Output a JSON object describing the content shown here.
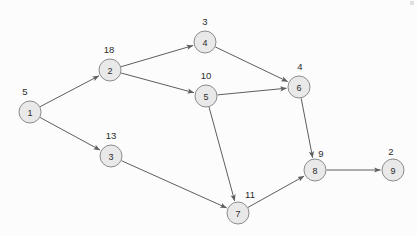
{
  "diagram": {
    "background_color": "#fcfcfc",
    "node_fill_color": "#e9e9e9",
    "node_stroke_color": "#8c8c8c",
    "edge_color": "#5e5e5e",
    "text_color": "#2b2b2b",
    "node_radius": 11,
    "nodes": [
      {
        "id": "1",
        "label": "1",
        "weight": "5",
        "cx": 30,
        "cy": 112,
        "wx": 25,
        "wy": 95
      },
      {
        "id": "2",
        "label": "2",
        "weight": "18",
        "cx": 110,
        "cy": 70,
        "wx": 109,
        "wy": 53
      },
      {
        "id": "3",
        "label": "3",
        "weight": "13",
        "cx": 111,
        "cy": 156,
        "wx": 111,
        "wy": 139
      },
      {
        "id": "4",
        "label": "4",
        "weight": "3",
        "cx": 205,
        "cy": 42,
        "wx": 205,
        "wy": 25
      },
      {
        "id": "5",
        "label": "5",
        "weight": "10",
        "cx": 206,
        "cy": 96,
        "wx": 206,
        "wy": 79
      },
      {
        "id": "6",
        "label": "6",
        "weight": "4",
        "cx": 299,
        "cy": 87,
        "wx": 300,
        "wy": 70
      },
      {
        "id": "7",
        "label": "7",
        "weight": "11",
        "cx": 238,
        "cy": 213,
        "wx": 250,
        "wy": 198
      },
      {
        "id": "8",
        "label": "8",
        "weight": "9",
        "cx": 315,
        "cy": 170,
        "wx": 321,
        "wy": 157
      },
      {
        "id": "9",
        "label": "9",
        "weight": "2",
        "cx": 393,
        "cy": 170,
        "wx": 391,
        "wy": 155
      }
    ],
    "edges": [
      {
        "from": "1",
        "to": "2",
        "directed": true
      },
      {
        "from": "1",
        "to": "3",
        "directed": true
      },
      {
        "from": "2",
        "to": "4",
        "directed": true
      },
      {
        "from": "2",
        "to": "5",
        "directed": true
      },
      {
        "from": "4",
        "to": "6",
        "directed": true
      },
      {
        "from": "5",
        "to": "6",
        "directed": true
      },
      {
        "from": "5",
        "to": "7",
        "directed": true
      },
      {
        "from": "3",
        "to": "7",
        "directed": true
      },
      {
        "from": "6",
        "to": "8",
        "directed": true
      },
      {
        "from": "7",
        "to": "8",
        "directed": true
      },
      {
        "from": "8",
        "to": "9",
        "directed": true
      }
    ]
  }
}
